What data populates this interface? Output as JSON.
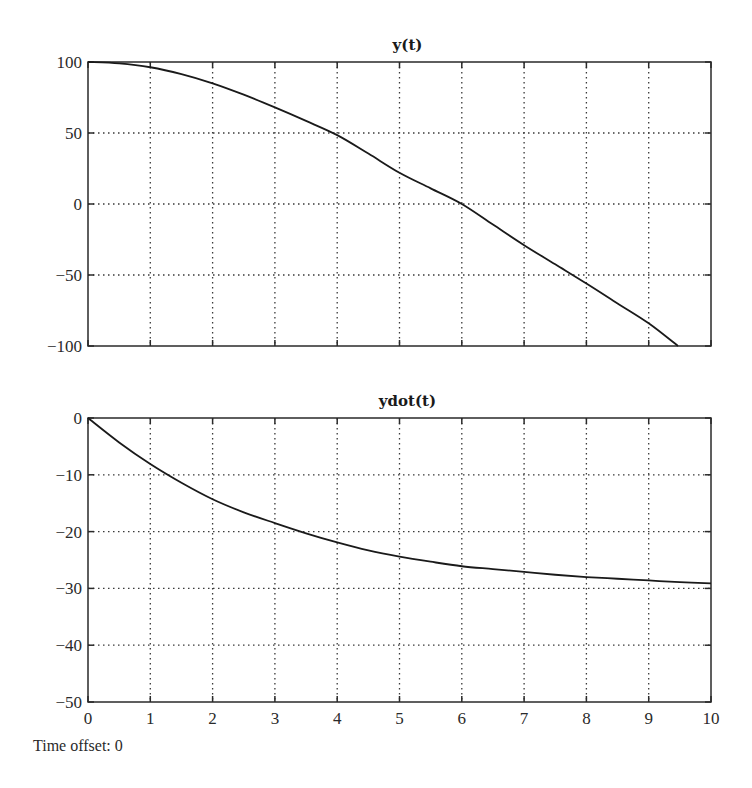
{
  "footer": {
    "time_offset_label": "Time offset: 0"
  },
  "chart_data": [
    {
      "type": "line",
      "title": "y(t)",
      "xlabel": "",
      "ylabel": "",
      "xlim": [
        0,
        10
      ],
      "ylim": [
        -100,
        100
      ],
      "grid": true,
      "x_ticks": [
        0,
        1,
        2,
        3,
        4,
        5,
        6,
        7,
        8,
        9,
        10
      ],
      "y_ticks": [
        100,
        50,
        0,
        -50,
        -100
      ],
      "y_tick_labels": [
        "100",
        "50",
        "0",
        "−50",
        "−100"
      ],
      "show_x_tick_labels": false,
      "series": [
        {
          "name": "y(t)",
          "x": [
            0,
            0.5,
            1,
            1.5,
            2,
            2.5,
            3,
            3.5,
            4,
            4.5,
            5,
            5.5,
            6,
            6.5,
            7,
            7.5,
            8,
            8.5,
            9,
            9.47
          ],
          "values": [
            100,
            99,
            96.3,
            91.5,
            85,
            77,
            68,
            58.5,
            48.5,
            35.5,
            22,
            11,
            0,
            -14.5,
            -29,
            -42.5,
            -56,
            -70,
            -84,
            -100
          ]
        }
      ],
      "plot_box": {
        "left": 88,
        "right": 711,
        "top": 62,
        "bottom": 346
      }
    },
    {
      "type": "line",
      "title": "ydot(t)",
      "xlabel": "",
      "ylabel": "",
      "xlim": [
        0,
        10
      ],
      "ylim": [
        -50,
        0
      ],
      "grid": true,
      "x_ticks": [
        0,
        1,
        2,
        3,
        4,
        5,
        6,
        7,
        8,
        9,
        10
      ],
      "x_tick_labels": [
        "0",
        "1",
        "2",
        "3",
        "4",
        "5",
        "6",
        "7",
        "8",
        "9",
        "10"
      ],
      "y_ticks": [
        0,
        -10,
        -20,
        -30,
        -40,
        -50
      ],
      "y_tick_labels": [
        "0",
        "−10",
        "−20",
        "−30",
        "−40",
        "−50"
      ],
      "show_x_tick_labels": true,
      "series": [
        {
          "name": "ydot(t)",
          "x": [
            0,
            0.5,
            1,
            1.5,
            2,
            2.5,
            3,
            3.5,
            4,
            4.5,
            5,
            5.5,
            6,
            6.5,
            7,
            7.5,
            8,
            8.5,
            9,
            9.5,
            10
          ],
          "values": [
            0,
            -4.3,
            -8.1,
            -11.4,
            -14.3,
            -16.6,
            -18.5,
            -20.3,
            -21.9,
            -23.3,
            -24.4,
            -25.3,
            -26.1,
            -26.6,
            -27.1,
            -27.6,
            -28.0,
            -28.3,
            -28.6,
            -28.9,
            -29.1
          ]
        }
      ],
      "plot_box": {
        "left": 88,
        "right": 711,
        "top": 418,
        "bottom": 702
      }
    }
  ],
  "colors": {
    "axis": "#2a2a2a",
    "grid": "#3a3a3a",
    "line": "#1a1a1a",
    "background": "#ffffff"
  }
}
